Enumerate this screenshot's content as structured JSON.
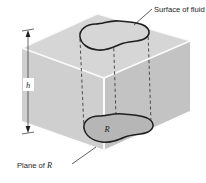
{
  "figure": {
    "kind": "isometric-box-diagram",
    "labels": {
      "surface_of_fluid": "Surface of fluid",
      "plane_of_r": "Plane of R",
      "depth_symbol": "h",
      "region_symbol": "R"
    },
    "colors": {
      "top_face": "#d4d4d4",
      "left_face": "#cbcbcb",
      "right_face": "#c2c2c2",
      "edge_highlight": "#fbfbfb",
      "outline": "#232323",
      "region_fill": "#b4b4b4",
      "dashed_line": "#3a3a3a",
      "text": "#1d1d1d",
      "background": "#ffffff"
    },
    "geometry": {
      "top_face_points": "97,14 190,41 104,78 22,48",
      "left_face_points": "22,48 104,78 104,150 22,122",
      "right_face_points": "104,78 190,41 190,112 104,150",
      "front_vertical_edge": [
        104,
        78,
        104,
        150
      ],
      "top_left_edge": [
        22,
        48,
        97,
        14
      ],
      "top_right_edge": [
        97,
        14,
        190,
        41
      ],
      "top_front_left_edge": [
        22,
        48,
        104,
        78
      ],
      "top_front_right_edge": [
        104,
        78,
        190,
        41
      ]
    },
    "blobs": {
      "top_curve": "M 96,24 C 86,24 79,30 80,37 C 81,44 89,49 99,50 C 108,51 115,47 122,44 C 130,41 139,42 144,40 C 150,38 151,31 145,27 C 139,23 128,23 119,22 C 110,21 103,24 96,24 Z",
      "bottom_curve": "M 99,116 C 90,116 83,122 84,129 C 85,136 93,141 103,142 C 112,143 119,139 126,136 C 134,133 143,134 148,132 C 154,130 155,123 149,119 C 143,115 132,115 123,114 C 114,113 106,116 99,116 Z"
    },
    "projection_lines": [
      [
        80,
        38,
        84,
        130
      ],
      [
        113,
        24,
        116,
        116
      ],
      [
        147,
        30,
        150,
        122
      ]
    ],
    "dimension": {
      "line": [
        28,
        32,
        28,
        131
      ],
      "arrow_top_y": 32,
      "arrow_bottom_y": 131,
      "label_x": 28,
      "label_y": 85
    },
    "leaders": {
      "surface_of_fluid": [
        135,
        24,
        152,
        10
      ],
      "plane_of_r": [
        73,
        163,
        95,
        148
      ]
    },
    "label_positions": {
      "surface_of_fluid": [
        155,
        12
      ],
      "plane_of_r": [
        18,
        168
      ],
      "region_symbol": [
        107,
        131
      ]
    }
  }
}
